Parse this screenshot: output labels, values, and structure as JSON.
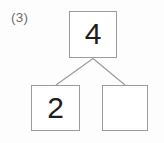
{
  "problem": {
    "number_label": "(3)",
    "type": "number-bond",
    "total": {
      "value": "4",
      "filled": true
    },
    "parts": [
      {
        "position": "left",
        "value": "2",
        "filled": true
      },
      {
        "position": "right",
        "value": "",
        "filled": false
      }
    ]
  },
  "colors": {
    "background": "#fdfdfd",
    "box_border": "#9b9b9b",
    "box_fill": "#ffffff",
    "digit": "#1e1e1e",
    "label": "#6e6e6e",
    "connector": "#9b9b9b"
  }
}
